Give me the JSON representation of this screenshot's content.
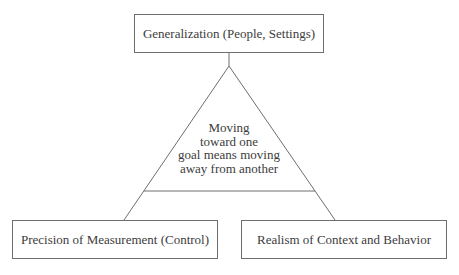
{
  "diagram": {
    "top_box": {
      "label": "Generalization (People, Settings)"
    },
    "left_box": {
      "label": "Precision of Measurement (Control)"
    },
    "right_box": {
      "label": "Realism of Context and Behavior"
    },
    "triangle": {
      "lines": [
        "Moving",
        "toward one",
        "goal means moving",
        "away from another"
      ]
    },
    "colors": {
      "line": "#6e6e6e",
      "text": "#3c3c3c",
      "background": "#ffffff"
    }
  }
}
